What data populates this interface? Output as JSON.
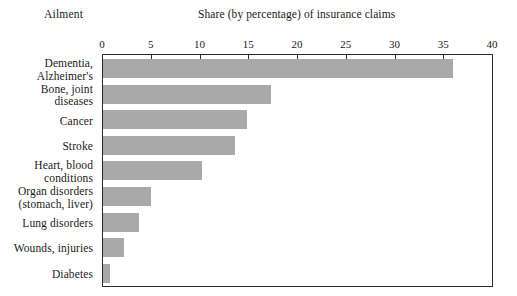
{
  "header": {
    "category_axis_label": "Ailment",
    "title": "Share (by percentage) of insurance claims"
  },
  "chart_data": {
    "type": "bar",
    "orientation": "horizontal",
    "title": "Share (by percentage) of insurance claims",
    "xlabel": "Share (by percentage) of insurance claims",
    "ylabel": "Ailment",
    "xlim": [
      0,
      40
    ],
    "xticks": [
      0,
      5,
      10,
      15,
      20,
      25,
      30,
      35,
      40
    ],
    "xtick_labels": [
      "0",
      "5",
      "10",
      "15",
      "20",
      "25",
      "30",
      "35",
      "40"
    ],
    "grid": false,
    "legend": "none",
    "bar_color": "#a9a9a9",
    "axis_color": "#2b2b2b",
    "categories": [
      "Dementia, Alzheimer's",
      "Bone, joint diseases",
      "Cancer",
      "Stroke",
      "Heart, blood conditions",
      "Organ disorders (stomach, liver)",
      "Lung disorders",
      "Wounds, injuries",
      "Diabetes"
    ],
    "category_lines": [
      [
        "Dementia,",
        "Alzheimer's"
      ],
      [
        "Bone, joint",
        "diseases"
      ],
      [
        "Cancer"
      ],
      [
        "Stroke"
      ],
      [
        "Heart, blood",
        "conditions"
      ],
      [
        "Organ disorders",
        "(stomach, liver)"
      ],
      [
        "Lung disorders"
      ],
      [
        "Wounds, injuries"
      ],
      [
        "Diabetes"
      ]
    ],
    "values": [
      35.9,
      17.2,
      14.8,
      13.5,
      10.2,
      4.9,
      3.7,
      2.2,
      0.7
    ]
  }
}
